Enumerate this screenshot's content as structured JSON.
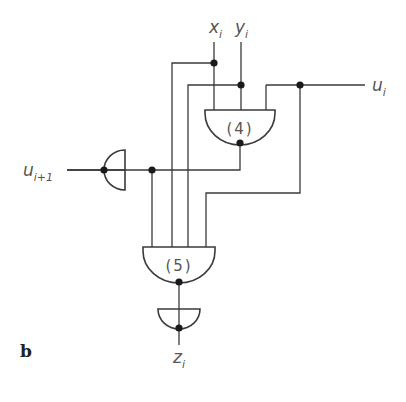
{
  "figure": {
    "panel_label": "b"
  },
  "signals": {
    "x": {
      "base": "x",
      "sub": "i"
    },
    "y": {
      "base": "y",
      "sub": "i"
    },
    "u_out": {
      "base": "u",
      "sub": "i"
    },
    "u_in": {
      "base": "u",
      "sub": "i+1"
    },
    "z": {
      "base": "z",
      "sub": "i"
    }
  },
  "gates": {
    "gate4": {
      "label": "(4)"
    },
    "gate5": {
      "label": "(5)"
    },
    "inverter_left": {
      "label": ""
    },
    "inverter_bottom": {
      "label": ""
    }
  },
  "colors": {
    "line": "#3a3a3a",
    "text": "#555555"
  }
}
